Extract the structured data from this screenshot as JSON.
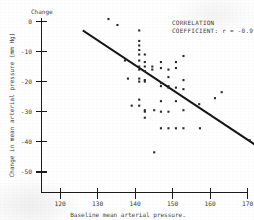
{
  "chart_data": {
    "type": "scatter",
    "title": "Change",
    "xlabel": "Baseline mean arterial pressure.",
    "ylabel": "Change in mean arterial pressure (mm Hg)",
    "xlim": [
      115,
      170
    ],
    "ylim": [
      -52,
      2
    ],
    "grid": false,
    "legend_position": "none",
    "xticks": [
      120,
      130,
      140,
      150,
      160,
      170
    ],
    "xtick_labels": [
      "120",
      "130",
      "140",
      "150",
      "160",
      "170"
    ],
    "yticks": [
      0,
      -10,
      -20,
      -30,
      -40,
      -50
    ],
    "ytick_labels": [
      "0",
      "-10",
      "-20",
      "-30",
      "-40",
      "-50"
    ],
    "annotations": [
      {
        "name": "correlation-label-line1",
        "text": "CORRELATION"
      },
      {
        "name": "correlation-label-line2",
        "text": "COEFFICIENT:  r = -0.916"
      }
    ],
    "correlation_coefficient": -0.916,
    "fit_line": {
      "name": "regression-line",
      "x_start": 115.2,
      "y_start": -3.2,
      "x_end": 167.0,
      "y_end": -46.0,
      "slope": -0.826,
      "intercept": 91.9,
      "color": "#141414"
    },
    "point_color": "#2a2a2a",
    "n_points": 61,
    "points": [
      [
        121.8,
        0.8
      ],
      [
        124.2,
        -1.2
      ],
      [
        126.2,
        -13.0
      ],
      [
        127.0,
        -19.0
      ],
      [
        128.0,
        -28.0
      ],
      [
        130.0,
        -3.0
      ],
      [
        130.0,
        -6.5
      ],
      [
        130.0,
        -8.0
      ],
      [
        130.0,
        -9.5
      ],
      [
        130.0,
        -11.0
      ],
      [
        130.0,
        -13.0
      ],
      [
        130.0,
        -15.0
      ],
      [
        130.0,
        -16.0
      ],
      [
        130.0,
        -19.0
      ],
      [
        130.0,
        -20.0
      ],
      [
        130.0,
        -26.0
      ],
      [
        130.0,
        -28.0
      ],
      [
        131.5,
        -11.0
      ],
      [
        131.5,
        -13.5
      ],
      [
        131.5,
        -15.0
      ],
      [
        131.5,
        -16.5
      ],
      [
        131.5,
        -19.5
      ],
      [
        131.5,
        -20.0
      ],
      [
        131.5,
        -29.5
      ],
      [
        131.5,
        -30.0
      ],
      [
        131.5,
        -32.0
      ],
      [
        133.5,
        -15.0
      ],
      [
        133.5,
        -16.0
      ],
      [
        134.0,
        -29.5
      ],
      [
        134.0,
        -43.5
      ],
      [
        135.8,
        -13.5
      ],
      [
        135.8,
        -15.5
      ],
      [
        135.8,
        -20.5
      ],
      [
        135.8,
        -21.5
      ],
      [
        135.8,
        -26.5
      ],
      [
        135.8,
        -30.0
      ],
      [
        135.8,
        -35.5
      ],
      [
        137.8,
        -16.0
      ],
      [
        137.8,
        -18.5
      ],
      [
        137.8,
        -21.5
      ],
      [
        137.8,
        -22.0
      ],
      [
        137.8,
        -30.0
      ],
      [
        137.8,
        -35.5
      ],
      [
        139.8,
        -13.5
      ],
      [
        139.8,
        -15.5
      ],
      [
        139.8,
        -22.0
      ],
      [
        139.8,
        -26.5
      ],
      [
        139.8,
        -35.5
      ],
      [
        141.8,
        -11.5
      ],
      [
        141.8,
        -19.5
      ],
      [
        141.8,
        -22.5
      ],
      [
        141.8,
        -29.5
      ],
      [
        141.8,
        -35.5
      ],
      [
        146.0,
        -27.5
      ],
      [
        146.2,
        -35.5
      ],
      [
        150.2,
        -25.5
      ],
      [
        152.0,
        -23.5
      ],
      [
        159.5,
        -39.5
      ],
      [
        162.0,
        -37.5
      ]
    ]
  }
}
